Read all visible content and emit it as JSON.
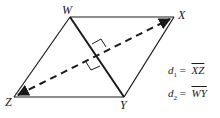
{
  "figure": {
    "type": "rhombus-diagonals",
    "vertices": [
      {
        "name": "W",
        "label": "W"
      },
      {
        "name": "X",
        "label": "X"
      },
      {
        "name": "Y",
        "label": "Y"
      },
      {
        "name": "Z",
        "label": "Z"
      }
    ],
    "sides": [
      "WX",
      "XY",
      "YZ",
      "ZW"
    ],
    "diagonals": [
      {
        "name": "d1",
        "endpoints": "XZ",
        "style": "dashed",
        "arrowheads": true
      },
      {
        "name": "d2",
        "endpoints": "WY",
        "style": "solid-thick"
      }
    ],
    "right_angle_marks": 2
  },
  "legend": {
    "d1": {
      "symbol": "d",
      "subscript": "1",
      "equals": "=",
      "segment": "XZ"
    },
    "d2": {
      "symbol": "d",
      "subscript": "2",
      "equals": "=",
      "segment": "WY"
    }
  },
  "colors": {
    "ink": "#1a1a1a",
    "background": "#ffffff"
  }
}
